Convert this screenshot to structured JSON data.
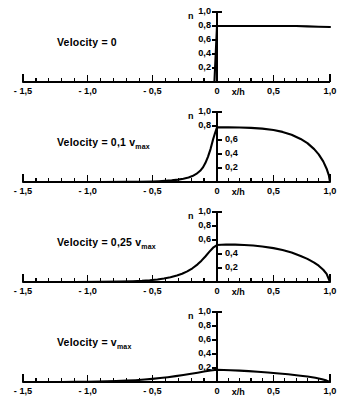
{
  "figure": {
    "title": "",
    "axis_label_x": "x/h",
    "axis_label_y": "n"
  },
  "chart_data": {
    "type": "line",
    "title": "",
    "xlabel": "x/h",
    "ylabel": "n",
    "xlim": [
      -1.5,
      1.0
    ],
    "ylim": [
      0.0,
      1.0
    ],
    "grid": false,
    "legend": "none",
    "xticks": [
      -1.5,
      -1.0,
      -0.5,
      0.0,
      0.5,
      1.0
    ],
    "xticklabels": [
      "- 1,5",
      "- 1,0",
      "- 0,5",
      "0",
      "0,5",
      "1,0"
    ],
    "xminor_step": 0.1,
    "yticks": [
      0.2,
      0.4,
      0.6,
      0.8,
      1.0
    ],
    "yticklabels": [
      "0,2",
      "0,4",
      "0,6",
      "0,8",
      "1,0"
    ],
    "panels": [
      {
        "id": "panel-velocity-0",
        "annotation": "Velocity = 0",
        "annotation_prefix": "Velocity = ",
        "annotation_value": "0",
        "annotation_sub": "",
        "ylabels_side": [
          "left",
          "left",
          "left",
          "left",
          "left"
        ],
        "peak_value": 0.8,
        "x": [
          -1.5,
          -1.4,
          -1.3,
          -1.2,
          -1.1,
          -1.0,
          -0.9,
          -0.8,
          -0.7,
          -0.6,
          -0.5,
          -0.4,
          -0.3,
          -0.2,
          -0.1,
          -0.02,
          0.0,
          0.1,
          0.2,
          0.3,
          0.4,
          0.5,
          0.6,
          0.7,
          0.8,
          0.9,
          1.0
        ],
        "y": [
          0.0,
          0.0,
          0.0,
          0.0,
          0.0,
          0.0,
          0.0,
          0.0,
          0.0,
          0.0,
          0.0,
          0.0,
          0.0,
          0.0,
          0.0,
          0.0,
          0.8,
          0.8,
          0.8,
          0.8,
          0.8,
          0.8,
          0.8,
          0.8,
          0.795,
          0.79,
          0.785
        ]
      },
      {
        "id": "panel-velocity-0-1",
        "annotation": "Velocity = 0,1 vmax",
        "annotation_prefix": "Velocity = ",
        "annotation_value": "0,1 v",
        "annotation_sub": "max",
        "ylabels_side": [
          "right",
          "right",
          "right",
          "left",
          "left"
        ],
        "peak_value": 0.78,
        "x": [
          -1.5,
          -1.3,
          -1.1,
          -0.9,
          -0.7,
          -0.6,
          -0.5,
          -0.45,
          -0.4,
          -0.35,
          -0.3,
          -0.26,
          -0.22,
          -0.19,
          -0.16,
          -0.13,
          -0.11,
          -0.09,
          -0.07,
          -0.05,
          -0.03,
          -0.015,
          0.0,
          0.1,
          0.2,
          0.3,
          0.4,
          0.5,
          0.58,
          0.66,
          0.74,
          0.8,
          0.86,
          0.9,
          0.94,
          0.97,
          0.99,
          1.0
        ],
        "y": [
          0.0,
          0.0,
          0.0,
          0.0,
          0.002,
          0.004,
          0.008,
          0.011,
          0.016,
          0.023,
          0.034,
          0.046,
          0.065,
          0.085,
          0.115,
          0.16,
          0.205,
          0.27,
          0.36,
          0.47,
          0.61,
          0.7,
          0.78,
          0.78,
          0.778,
          0.773,
          0.762,
          0.742,
          0.716,
          0.676,
          0.615,
          0.555,
          0.47,
          0.395,
          0.295,
          0.19,
          0.095,
          0.0
        ]
      },
      {
        "id": "panel-velocity-0-25",
        "annotation": "Velocity = 0,25 vmax",
        "annotation_prefix": "Velocity = ",
        "annotation_value": "0,25 v",
        "annotation_sub": "max",
        "ylabels_side": [
          "right",
          "right",
          "left",
          "left",
          "left"
        ],
        "peak_value": 0.535,
        "x": [
          -1.5,
          -1.3,
          -1.1,
          -0.9,
          -0.75,
          -0.65,
          -0.58,
          -0.52,
          -0.46,
          -0.41,
          -0.36,
          -0.31,
          -0.27,
          -0.23,
          -0.19,
          -0.15,
          -0.12,
          -0.09,
          -0.06,
          -0.03,
          0.0,
          0.08,
          0.16,
          0.24,
          0.32,
          0.4,
          0.5,
          0.58,
          0.66,
          0.74,
          0.8,
          0.86,
          0.9,
          0.94,
          0.97,
          1.0
        ],
        "y": [
          0.0,
          0.0,
          0.001,
          0.003,
          0.006,
          0.011,
          0.017,
          0.025,
          0.036,
          0.05,
          0.068,
          0.092,
          0.118,
          0.152,
          0.196,
          0.252,
          0.305,
          0.365,
          0.43,
          0.49,
          0.528,
          0.535,
          0.534,
          0.529,
          0.521,
          0.508,
          0.484,
          0.458,
          0.422,
          0.372,
          0.33,
          0.277,
          0.233,
          0.175,
          0.115,
          0.0
        ]
      },
      {
        "id": "panel-velocity-vmax",
        "annotation": "Velocity = vmax",
        "annotation_prefix": "Velocity = ",
        "annotation_value": "v",
        "annotation_sub": "max",
        "ylabels_side": [
          "left",
          "left",
          "left",
          "left",
          "left"
        ],
        "peak_value": 0.175,
        "x": [
          -1.5,
          -1.35,
          -1.2,
          -1.1,
          -1.0,
          -0.92,
          -0.85,
          -0.78,
          -0.7,
          -0.63,
          -0.56,
          -0.5,
          -0.44,
          -0.38,
          -0.32,
          -0.26,
          -0.2,
          -0.15,
          -0.1,
          -0.05,
          0.0,
          0.06,
          0.12,
          0.2,
          0.28,
          0.36,
          0.45,
          0.55,
          0.63,
          0.72,
          0.8,
          0.87,
          0.93,
          0.97,
          1.0
        ],
        "y": [
          0.0,
          0.0,
          0.001,
          0.002,
          0.004,
          0.006,
          0.009,
          0.013,
          0.019,
          0.026,
          0.035,
          0.045,
          0.056,
          0.069,
          0.084,
          0.1,
          0.118,
          0.133,
          0.149,
          0.164,
          0.175,
          0.172,
          0.168,
          0.162,
          0.155,
          0.147,
          0.136,
          0.122,
          0.11,
          0.094,
          0.078,
          0.06,
          0.04,
          0.02,
          0.0
        ]
      }
    ]
  },
  "geometry": {
    "panel_height": 100,
    "baseline_y": 82,
    "axis_top_y": 12,
    "x_left_px": 23,
    "x_zero_px": 217,
    "x_right_px": 330
  }
}
